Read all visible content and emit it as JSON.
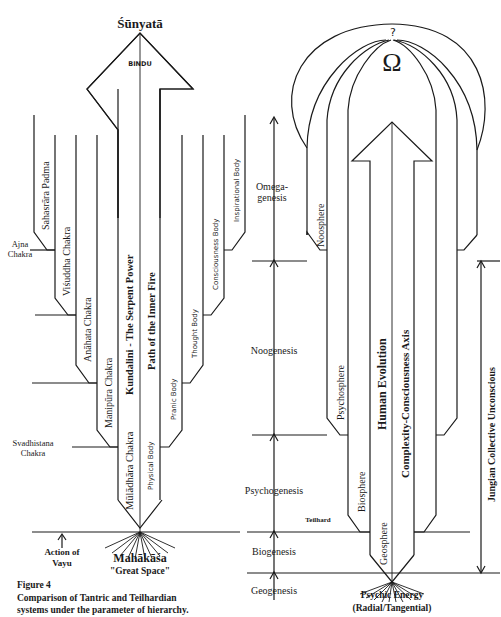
{
  "left": {
    "top_label": "Śūnyatā",
    "bindu": "BINDU",
    "main_axis_1": "Kundalini - The Serpent Power",
    "main_axis_2": "Path of the Inner Fire",
    "chakras": [
      "Sahasrāra Padma",
      "Viśuddha Chakra",
      "Anāhata Chakra",
      "Manipūra Chakra",
      "Mūlādhāra Chakra"
    ],
    "side_chakras": {
      "ajna": [
        "Ajna",
        "Chakra"
      ],
      "svadhistana": [
        "Svadhistana",
        "Chakra"
      ]
    },
    "bodies": [
      "Physical Body",
      "Pranic Body",
      "Thought Body",
      "Consciousness Body",
      "Inspirational Body"
    ],
    "vayu": [
      "Action of",
      "Vayu"
    ],
    "bottom_label": "Mahākāśa",
    "bottom_sub": "\"Great Space\""
  },
  "right": {
    "omega_question": "?",
    "omega_symbol": "Ω",
    "main_axis_1": "Human Evolution",
    "main_axis_2": "Complexity-Consciousness Axis",
    "spheres": [
      "Geosphere",
      "Biosphere",
      "Psychosphere",
      "Noosphere"
    ],
    "geneses": [
      [
        "Omega-",
        "genesis"
      ],
      [
        "Noogenesis"
      ],
      [
        "Psychogenesis"
      ],
      [
        "Biogenesis"
      ],
      [
        "Geogenesis"
      ]
    ],
    "teilhard": "Teilhard",
    "jungian": "Jungian Collective Unconscious",
    "bottom_label": "Psychic Energy",
    "bottom_sub": "(Radial/Tangential)"
  },
  "caption": {
    "title": "Figure 4",
    "line1": "Comparison of Tantric and Teilhardian",
    "line2": "systems under the parameter of hierarchy."
  }
}
